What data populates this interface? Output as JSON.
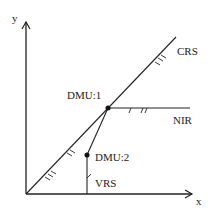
{
  "diagram": {
    "axes": {
      "x_label": "x",
      "y_label": "y"
    },
    "labels": {
      "crs": "CRS",
      "nir": "NIR",
      "vrs": "VRS",
      "dmu1": "DMU:1",
      "dmu2": "DMU:2"
    },
    "colors": {
      "line": "#222222",
      "background": "#ffffff"
    }
  }
}
